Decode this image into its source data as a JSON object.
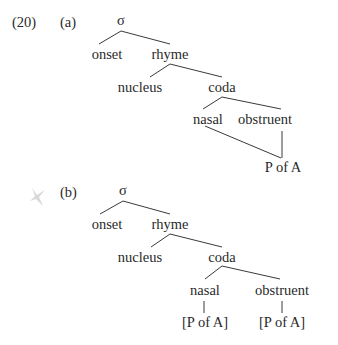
{
  "example_number": "(20)",
  "tree_a": {
    "label": "(a)",
    "root": "σ",
    "onset": "onset",
    "rhyme": "rhyme",
    "nucleus": "nucleus",
    "coda": "coda",
    "nasal": "nasal",
    "obstruent": "obstruent",
    "shared_feature": "P of A"
  },
  "tree_b": {
    "label": "(b)",
    "root": "σ",
    "onset": "onset",
    "rhyme": "rhyme",
    "nucleus": "nucleus",
    "coda": "coda",
    "nasal": "nasal",
    "obstruent": "obstruent",
    "nasal_feature": "[P of A]",
    "obstruent_feature": "[P of A]"
  }
}
